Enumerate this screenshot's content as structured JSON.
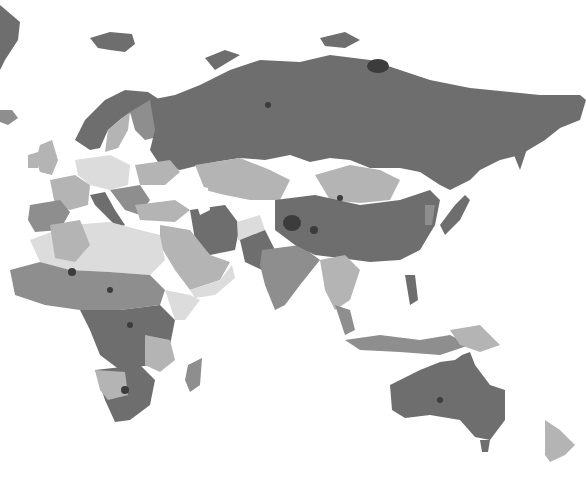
{
  "map": {
    "type": "choropleth",
    "projection": "equirectangular-eastern-hemisphere",
    "background": "#ffffff",
    "palette": {
      "darkest_spots": "#3c3c3c",
      "dark": "#6e6e6e",
      "mid": "#8e8e8e",
      "light": "#b4b4b4",
      "pale": "#dcdcdc"
    },
    "regions_visible": [
      "Europe",
      "Russia",
      "Central Asia",
      "Middle East",
      "South Asia",
      "East Asia",
      "Southeast Asia",
      "Africa",
      "Australia",
      "New Zealand",
      "Pacific Islands"
    ],
    "legend": null,
    "title": null
  }
}
